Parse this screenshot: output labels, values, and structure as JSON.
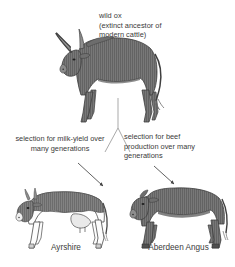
{
  "diagram": {
    "background_color": "#ffffff",
    "text_color": "#3a3a3a",
    "body_fill_color": "#777777",
    "hatch_color": "#5e5e5e",
    "outline_color": "#3f3f3f",
    "labels": {
      "wild_ox": "wild ox\n(extinct ancestor of\nmodern cattle)",
      "milk_selection": "selection for milk-yield over\nmany generations",
      "beef_selection": "selection for beef\nproduction over many\ngenerations"
    },
    "captions": {
      "ayrshire": "Ayrshire",
      "aberdeen_angus": "Aberdeen Angus"
    },
    "figures": [
      {
        "name": "wild-ox",
        "label": "wild ox",
        "facing": "left",
        "horns": "long curved",
        "shading": "solid grey with vertical hatching"
      },
      {
        "name": "ayrshire-cow",
        "label": "Ayrshire",
        "facing": "left",
        "horns": "short",
        "shading": "grey upper body, white underside, udder visible",
        "breed_type": "dairy"
      },
      {
        "name": "aberdeen-angus-cow",
        "label": "Aberdeen Angus",
        "facing": "left",
        "horns": "none",
        "shading": "solid grey with vertical hatching",
        "breed_type": "beef"
      }
    ],
    "connectors": [
      {
        "name": "trunk-line",
        "from": "wild-ox",
        "to": "branch-point"
      },
      {
        "name": "branch-left",
        "from": "branch-point",
        "to": "milk_selection"
      },
      {
        "name": "branch-right",
        "from": "branch-point",
        "to": "beef_selection"
      },
      {
        "name": "arrow-to-ayrshire",
        "from": "milk_selection",
        "to": "ayrshire-cow"
      },
      {
        "name": "arrow-to-angus",
        "from": "beef_selection",
        "to": "aberdeen-angus-cow"
      }
    ]
  }
}
